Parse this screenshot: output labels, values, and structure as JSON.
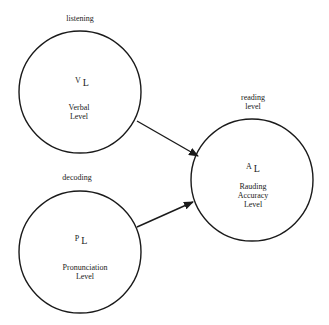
{
  "diagram": {
    "nodes": [
      {
        "id": "verbal",
        "outer_label": "listening",
        "symbol": "V",
        "subscript": "L",
        "inner_label_lines": [
          "Verbal",
          "Level"
        ]
      },
      {
        "id": "pronunciation",
        "outer_label": "decoding",
        "symbol": "P",
        "subscript": "L",
        "inner_label_lines": [
          "Pronunciation",
          "Level"
        ]
      },
      {
        "id": "rauding",
        "outer_label_lines": [
          "reading",
          "level"
        ],
        "symbol": "A",
        "subscript": "L",
        "inner_label_lines": [
          "Rauding",
          "Accuracy",
          "Level"
        ]
      }
    ],
    "edges": [
      {
        "from": "verbal",
        "to": "rauding"
      },
      {
        "from": "pronunciation",
        "to": "rauding"
      }
    ],
    "colors": {
      "stroke": "#1a1a1a",
      "background": "#ffffff"
    }
  }
}
